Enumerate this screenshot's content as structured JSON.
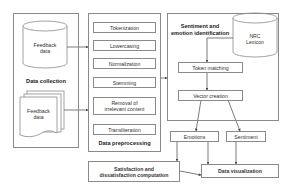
{
  "diagram": {
    "data_collection": {
      "label": "Data collection",
      "database": {
        "line1": "Feedback",
        "line2": "data"
      },
      "documents": {
        "line1": "Feedback",
        "line2": "data"
      }
    },
    "data_preprocessing": {
      "label": "Data preprocessing",
      "steps": [
        {
          "label": "Tokenization"
        },
        {
          "label": "Lowercasing"
        },
        {
          "label": "Normalization"
        },
        {
          "label": "Stemming"
        },
        {
          "label_line1": "Removal of",
          "label_line2": "irrelevant content"
        },
        {
          "label": "Transliteration"
        }
      ]
    },
    "sentiment_identification": {
      "label_line1": "Sentiment and",
      "label_line2": "emotion identification",
      "lexicon": {
        "line1": "NRC",
        "line2": "Lexicon"
      },
      "token_matching": "Token matching",
      "vector_creation": "Vector creation"
    },
    "outputs": {
      "emotions": "Emotions",
      "sentiment": "Sentiment",
      "satisfaction_line1": "Satisfaction and",
      "satisfaction_line2": "dissatisfaction computation",
      "data_visualization": "Data visualization"
    },
    "colors": {
      "border": "#8a8a8a",
      "line": "#444444",
      "text": "#222222",
      "background": "#ffffff"
    }
  }
}
